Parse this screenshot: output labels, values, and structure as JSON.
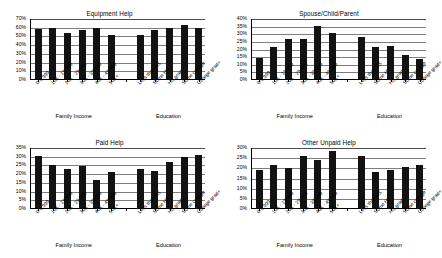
{
  "chart_data": [
    {
      "type": "bar",
      "title": "Equipment Help",
      "xlabel": "",
      "ylabel": "",
      "ylim": [
        0,
        70
      ],
      "ytick_step": 10,
      "ytick_labels": [
        "0%",
        "10%",
        "20%",
        "30%",
        "40%",
        "50%",
        "60%",
        "70%"
      ],
      "grid": true,
      "legend": "none",
      "groups": [
        {
          "name": "Family Income",
          "categories": [
            "0-9,999",
            "10K - 19,999",
            "20K - 29,999",
            "30K - 39,999",
            "40K - 49,999",
            "50K+"
          ],
          "values": [
            57,
            58,
            53,
            56,
            58,
            50
          ]
        },
        {
          "name": "Education",
          "categories": [
            "Less than HS",
            "Some HS",
            "HS grad",
            "Some college",
            "College grad+"
          ],
          "values": [
            50,
            56,
            59,
            62,
            58
          ]
        }
      ]
    },
    {
      "type": "bar",
      "title": "Spouse/Child/Parent",
      "xlabel": "",
      "ylabel": "",
      "ylim": [
        0,
        40
      ],
      "ytick_step": 5,
      "ytick_labels": [
        "0%",
        "5%",
        "10%",
        "15%",
        "20%",
        "25%",
        "30%",
        "35%",
        "40%"
      ],
      "grid": true,
      "legend": "none",
      "groups": [
        {
          "name": "Family Income",
          "categories": [
            "0-9,999",
            "10K - 19,999",
            "20K - 29,999",
            "30K - 39,999",
            "40K - 49,999",
            "50K+"
          ],
          "values": [
            13.5,
            21,
            26,
            26.5,
            34.5,
            30
          ]
        },
        {
          "name": "Education",
          "categories": [
            "Less than HS",
            "Some HS",
            "HS grad",
            "Some college",
            "College grad+"
          ],
          "values": [
            27.5,
            21,
            21.5,
            16,
            13
          ]
        }
      ]
    },
    {
      "type": "bar",
      "title": "Paid Help",
      "xlabel": "",
      "ylabel": "",
      "ylim": [
        0,
        35
      ],
      "ytick_step": 5,
      "ytick_labels": [
        "0%",
        "5%",
        "10%",
        "15%",
        "20%",
        "25%",
        "30%",
        "35%"
      ],
      "grid": true,
      "legend": "none",
      "groups": [
        {
          "name": "Family Income",
          "categories": [
            "0-9,999",
            "10K - 19,999",
            "20K - 29,999",
            "30K - 39,999",
            "40K - 49,999",
            "50K+"
          ],
          "values": [
            30,
            24.5,
            22.5,
            24,
            16,
            20.5
          ]
        },
        {
          "name": "Education",
          "categories": [
            "Less than HS",
            "Some HS",
            "HS grad",
            "Some college",
            "College grad+"
          ],
          "values": [
            22.5,
            21.5,
            26.5,
            29.5,
            30.5
          ]
        }
      ]
    },
    {
      "type": "bar",
      "title": "Other Unpaid Help",
      "xlabel": "",
      "ylabel": "",
      "ylim": [
        0,
        30
      ],
      "ytick_step": 5,
      "ytick_labels": [
        "0%",
        "5%",
        "10%",
        "15%",
        "20%",
        "25%",
        "30%"
      ],
      "grid": true,
      "legend": "none",
      "groups": [
        {
          "name": "Family Income",
          "categories": [
            "0-9,999",
            "10K - 19,999",
            "20K - 29,999",
            "30K - 39,999",
            "40K - 49,999",
            "50K+"
          ],
          "values": [
            18.5,
            21,
            19.5,
            25.5,
            23.5,
            28
          ]
        },
        {
          "name": "Education",
          "categories": [
            "Less than HS",
            "Some HS",
            "HS grad",
            "Some college",
            "College grad+"
          ],
          "values": [
            25.5,
            17.5,
            18.5,
            20,
            21
          ]
        }
      ]
    }
  ],
  "style": {
    "bar_color": "#121212",
    "grid_color": "#7d7d7d",
    "axis_color": "#000000",
    "background": "#ffffff"
  }
}
